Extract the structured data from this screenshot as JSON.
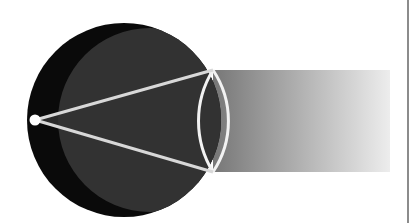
{
  "figure": {
    "title": "Point source illuminating a sphere with emergent gradient beam",
    "canvas": {
      "width": 419,
      "height": 223,
      "background": "#ffffff"
    },
    "colors": {
      "background": "#ffffff",
      "sphere_fill": "#0a0a0a",
      "shadow_cone_fill": "#2b2b2b",
      "lens_fill": "#323232",
      "ray_stroke": "#d8d8d8",
      "arc_stroke": "#f2f2f2",
      "source_fill": "#ffffff",
      "beam_start": "#777777",
      "beam_end": "#ededed",
      "border_line": "#8c8c8c"
    },
    "elements": {
      "point_source": {
        "label": "point-light-source",
        "cx": 35,
        "cy": 120,
        "r": 5.5,
        "fill": "#ffffff"
      },
      "sphere": {
        "label": "occluding-sphere",
        "cx": 124,
        "cy": 120,
        "r": 97,
        "fill": "#0a0a0a"
      },
      "lens_arc_left": {
        "label": "lens-arc-left",
        "cx": 124,
        "cy": 120,
        "r": 97
      },
      "lens_arc_right": {
        "label": "lens-arc-right",
        "cx": 150,
        "cy": 120,
        "r": 92
      },
      "tangent_point_upper": {
        "x": 213,
        "y": 70
      },
      "tangent_point_lower": {
        "x": 213,
        "y": 172
      },
      "ray_upper": {
        "label": "tangent-ray-upper",
        "x1": 35,
        "y1": 120,
        "x2": 213,
        "y2": 70,
        "stroke": "#d8d8d8",
        "width": 3
      },
      "ray_lower": {
        "label": "tangent-ray-lower",
        "x1": 35,
        "y1": 120,
        "x2": 213,
        "y2": 172,
        "stroke": "#d8d8d8",
        "width": 3
      },
      "beam": {
        "label": "gradient-beam",
        "x": 213,
        "y": 70,
        "width": 177,
        "height": 102,
        "gradient_from": "#777777",
        "gradient_to": "#ededed"
      },
      "right_rule": {
        "label": "right-vertical-rule",
        "x": 408,
        "y1": 0,
        "y2": 223,
        "stroke": "#8c8c8c",
        "width": 2
      }
    }
  },
  "chart_data": {
    "type": "diagram",
    "title": "Point source illuminating a sphere with emergent gradient beam",
    "annotations": [
      "white point source on the left rim of the black disc",
      "two light rays diverge from the source to the lens intersection points",
      "lens (vesica) region at the right of the disc outlined in white",
      "horizontal band fading from mid gray to near white toward the right"
    ]
  }
}
